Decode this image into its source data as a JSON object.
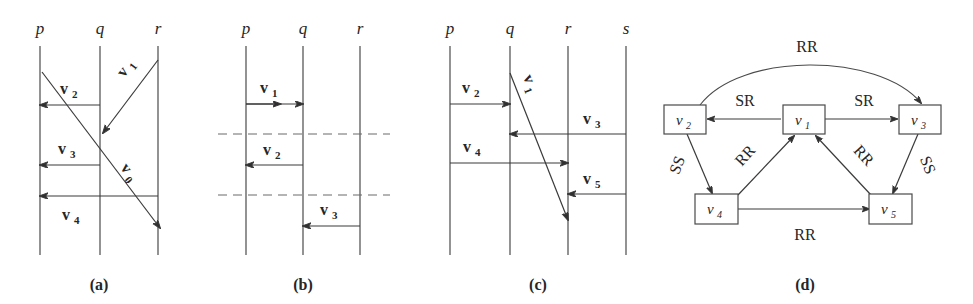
{
  "figure": {
    "background": "#ffffff",
    "ink": "#3a3a3a",
    "panels": [
      {
        "id": "a",
        "caption": "(a)",
        "processes": [
          "p",
          "q",
          "r"
        ],
        "messages": [
          {
            "label": "v",
            "sub": "2",
            "from": "q",
            "to": "p",
            "kind": "horizontal"
          },
          {
            "label": "v",
            "sub": "3",
            "from": "q",
            "to": "p",
            "kind": "horizontal"
          },
          {
            "label": "v",
            "sub": "4",
            "from": "r",
            "to": "p",
            "kind": "horizontal"
          },
          {
            "label": "v",
            "sub": "1",
            "from": "r",
            "to": "q",
            "kind": "diagonal"
          },
          {
            "label": "v",
            "sub": "0",
            "from": "p",
            "to": "r",
            "kind": "diagonal"
          }
        ]
      },
      {
        "id": "b",
        "caption": "(b)",
        "processes": [
          "p",
          "q",
          "r"
        ],
        "dashed_cuts": 2,
        "messages": [
          {
            "label": "v",
            "sub": "1",
            "from": "p",
            "to": "q",
            "kind": "horizontal-double"
          },
          {
            "label": "v",
            "sub": "2",
            "from": "q",
            "to": "p",
            "kind": "horizontal"
          },
          {
            "label": "v",
            "sub": "3",
            "from": "r",
            "to": "q",
            "kind": "horizontal"
          }
        ]
      },
      {
        "id": "c",
        "caption": "(c)",
        "processes": [
          "p",
          "q",
          "r",
          "s"
        ],
        "messages": [
          {
            "label": "v",
            "sub": "2",
            "from": "p",
            "to": "q",
            "kind": "horizontal"
          },
          {
            "label": "v",
            "sub": "3",
            "from": "s",
            "to": "q",
            "kind": "horizontal"
          },
          {
            "label": "v",
            "sub": "4",
            "from": "p",
            "to": "r",
            "kind": "horizontal"
          },
          {
            "label": "v",
            "sub": "5",
            "from": "s",
            "to": "r",
            "kind": "horizontal"
          },
          {
            "label": "v",
            "sub": "1",
            "from": "q",
            "to": "r",
            "kind": "diagonal"
          }
        ]
      },
      {
        "id": "d",
        "caption": "(d)",
        "nodes": [
          {
            "label": "v",
            "sub": "1"
          },
          {
            "label": "v",
            "sub": "2"
          },
          {
            "label": "v",
            "sub": "3"
          },
          {
            "label": "v",
            "sub": "4"
          },
          {
            "label": "v",
            "sub": "5"
          }
        ],
        "edges": [
          {
            "from": "v2",
            "to": "v3",
            "label": "RR",
            "shape": "arc"
          },
          {
            "from": "v1",
            "to": "v2",
            "label": "SR",
            "shape": "straight"
          },
          {
            "from": "v1",
            "to": "v3",
            "label": "SR",
            "shape": "straight"
          },
          {
            "from": "v2",
            "to": "v4",
            "label": "SS",
            "shape": "straight"
          },
          {
            "from": "v3",
            "to": "v5",
            "label": "SS",
            "shape": "straight"
          },
          {
            "from": "v4",
            "to": "v1",
            "label": "RR",
            "shape": "straight"
          },
          {
            "from": "v5",
            "to": "v1",
            "label": "RR",
            "shape": "straight"
          },
          {
            "from": "v4",
            "to": "v5",
            "label": "RR",
            "shape": "straight"
          }
        ]
      }
    ]
  },
  "panel_a": {
    "proc": {
      "p": "p",
      "q": "q",
      "r": "r"
    },
    "v1": {
      "v": "v",
      "s": "1"
    },
    "v2": {
      "v": "v",
      "s": "2"
    },
    "v3": {
      "v": "v",
      "s": "3"
    },
    "v4": {
      "v": "v",
      "s": "4"
    },
    "v0": {
      "v": "v",
      "s": "0"
    },
    "caption": "(a)"
  },
  "panel_b": {
    "proc": {
      "p": "p",
      "q": "q",
      "r": "r"
    },
    "v1": {
      "v": "v",
      "s": "1"
    },
    "v2": {
      "v": "v",
      "s": "2"
    },
    "v3": {
      "v": "v",
      "s": "3"
    },
    "caption": "(b)"
  },
  "panel_c": {
    "proc": {
      "p": "p",
      "q": "q",
      "r": "r",
      "s": "s"
    },
    "v1": {
      "v": "v",
      "s": "1"
    },
    "v2": {
      "v": "v",
      "s": "2"
    },
    "v3": {
      "v": "v",
      "s": "3"
    },
    "v4": {
      "v": "v",
      "s": "4"
    },
    "v5": {
      "v": "v",
      "s": "5"
    },
    "caption": "(c)"
  },
  "panel_d": {
    "n1": {
      "v": "v",
      "s": "1"
    },
    "n2": {
      "v": "v",
      "s": "2"
    },
    "n3": {
      "v": "v",
      "s": "3"
    },
    "n4": {
      "v": "v",
      "s": "4"
    },
    "n5": {
      "v": "v",
      "s": "5"
    },
    "e_arc_rr": "RR",
    "e_sr_left": "SR",
    "e_sr_right": "SR",
    "e_ss_left": "SS",
    "e_ss_right": "SS",
    "e_rr_left": "RR",
    "e_rr_right": "RR",
    "e_rr_bottom": "RR",
    "caption": "(d)"
  }
}
